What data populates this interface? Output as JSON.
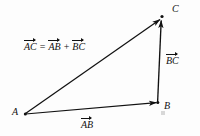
{
  "figure": {
    "background_color": "#fdfdfd",
    "ink_color": "#111111",
    "equation": {
      "lhs": "AC",
      "equals": "=",
      "term1": "AB",
      "plus": "+",
      "term2": "BC"
    },
    "vertices": [
      {
        "id": "A",
        "label": "A",
        "x": 25,
        "y": 114
      },
      {
        "id": "B",
        "label": "B",
        "x": 158,
        "y": 102
      },
      {
        "id": "C",
        "label": "C",
        "x": 162,
        "y": 17
      }
    ],
    "vectors": [
      {
        "id": "AC",
        "label": "AC",
        "from": "A",
        "to": "C"
      },
      {
        "id": "AB",
        "label": "AB",
        "from": "A",
        "to": "B"
      },
      {
        "id": "BC",
        "label": "BC",
        "from": "B",
        "to": "C"
      }
    ]
  }
}
